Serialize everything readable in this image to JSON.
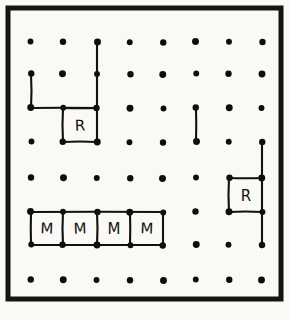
{
  "figure": {
    "frame": {
      "stroke_color": "#141414",
      "x": 8,
      "y": 8,
      "width": 273,
      "height": 291
    },
    "background_color": "#faf9f6",
    "ink_color": "#111111"
  },
  "grid": {
    "columns": 8,
    "rows": 7,
    "dot_color": "#0d0d0d",
    "dot_radius": 3.2,
    "x_positions": [
      31,
      63,
      97,
      130,
      163,
      196,
      229,
      262
    ],
    "y_positions": [
      42,
      74,
      108,
      142,
      178,
      212,
      245,
      280
    ],
    "row_count_used": 8
  },
  "edges": [
    {
      "name": "top-left-vertical-col0",
      "x1": 31,
      "y1": 74,
      "x2": 31,
      "y2": 108
    },
    {
      "name": "top-left-horizontal-row2",
      "x1": 31,
      "y1": 108,
      "x2": 97,
      "y2": 108
    },
    {
      "name": "long-vertical-col2",
      "x1": 97,
      "y1": 42,
      "x2": 97,
      "y2": 142
    },
    {
      "name": "r-left-cell-top",
      "x1": 63,
      "y1": 108,
      "x2": 97,
      "y2": 108
    },
    {
      "name": "r-left-cell-left",
      "x1": 63,
      "y1": 108,
      "x2": 63,
      "y2": 142
    },
    {
      "name": "r-left-cell-bottom",
      "x1": 63,
      "y1": 142,
      "x2": 97,
      "y2": 142
    },
    {
      "name": "isolated-vertical-col5",
      "x1": 196,
      "y1": 108,
      "x2": 196,
      "y2": 142
    },
    {
      "name": "r-right-vertical-col7",
      "x1": 262,
      "y1": 142,
      "x2": 262,
      "y2": 245
    },
    {
      "name": "r-right-cell-top",
      "x1": 229,
      "y1": 178,
      "x2": 262,
      "y2": 178
    },
    {
      "name": "r-right-cell-left",
      "x1": 229,
      "y1": 178,
      "x2": 229,
      "y2": 212
    },
    {
      "name": "r-right-cell-bottom",
      "x1": 229,
      "y1": 212,
      "x2": 262,
      "y2": 212
    },
    {
      "name": "m-row-top",
      "x1": 31,
      "y1": 212,
      "x2": 163,
      "y2": 212
    },
    {
      "name": "m-row-bottom",
      "x1": 31,
      "y1": 245,
      "x2": 163,
      "y2": 245
    },
    {
      "name": "m-divider-col0",
      "x1": 31,
      "y1": 212,
      "x2": 31,
      "y2": 245
    },
    {
      "name": "m-divider-col1",
      "x1": 63,
      "y1": 212,
      "x2": 63,
      "y2": 245
    },
    {
      "name": "m-divider-col2",
      "x1": 97,
      "y1": 212,
      "x2": 97,
      "y2": 245
    },
    {
      "name": "m-divider-col3",
      "x1": 130,
      "y1": 212,
      "x2": 130,
      "y2": 245
    },
    {
      "name": "m-divider-col4",
      "x1": 163,
      "y1": 212,
      "x2": 163,
      "y2": 245
    }
  ],
  "cells": [
    {
      "id": "cell-r-left",
      "label": "R",
      "cx": 80,
      "cy": 126
    },
    {
      "id": "cell-r-right",
      "label": "R",
      "cx": 246,
      "cy": 196
    },
    {
      "id": "cell-m-1",
      "label": "M",
      "cx": 47,
      "cy": 229
    },
    {
      "id": "cell-m-2",
      "label": "M",
      "cx": 80,
      "cy": 229
    },
    {
      "id": "cell-m-3",
      "label": "M",
      "cx": 114,
      "cy": 229
    },
    {
      "id": "cell-m-4",
      "label": "M",
      "cx": 147,
      "cy": 229
    }
  ]
}
